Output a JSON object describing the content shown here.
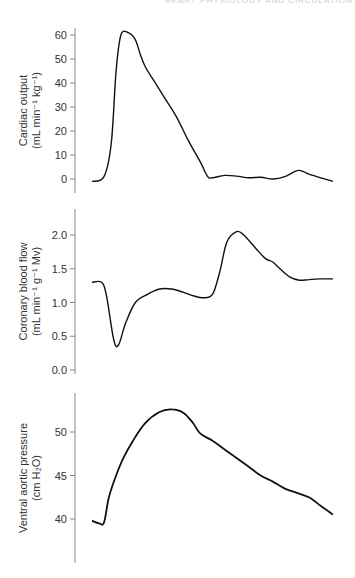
{
  "header": {
    "running_text": "HEART PHYSIOLOGY AND CIRCULATION"
  },
  "chart_data": [
    {
      "type": "line",
      "title": "",
      "xlabel": "",
      "ylabel": "Cardiac output (mL min⁻¹ kg⁻¹)",
      "ylabel_line1": "Cardiac output",
      "ylabel_line2": "(mL min⁻¹ kg⁻¹)",
      "yticks": [
        0,
        10,
        20,
        30,
        40,
        50,
        60
      ],
      "ylim": [
        -2,
        64
      ],
      "grid": false,
      "x": [
        0,
        5,
        8,
        10,
        12,
        15,
        18,
        20,
        22,
        25,
        30,
        35,
        40,
        45,
        48,
        50,
        55,
        60,
        65,
        70,
        75,
        80,
        85,
        88,
        90,
        95,
        100
      ],
      "series": [
        {
          "name": "Cardiac output",
          "values": [
            -1,
            1,
            15,
            45,
            60,
            61,
            58,
            52,
            47,
            42,
            34,
            26,
            16,
            7,
            1,
            0.5,
            1.5,
            1.2,
            0.5,
            0.7,
            0,
            1,
            3.5,
            3,
            2,
            0.5,
            -1
          ]
        }
      ]
    },
    {
      "type": "line",
      "title": "",
      "xlabel": "",
      "ylabel": "Coronary blood flow (mL min⁻¹ g⁻¹ Mv)",
      "ylabel_line1": "Coronary blood flow",
      "ylabel_line2": "(mL min⁻¹ g⁻¹ Mv)",
      "yticks": [
        0.0,
        0.5,
        1.0,
        1.5,
        2.0
      ],
      "ytick_labels": [
        "0.0",
        "0.5",
        "1.0",
        "1.5",
        "2.0"
      ],
      "ylim": [
        0,
        2.35
      ],
      "grid": false,
      "x": [
        0,
        4,
        6,
        9,
        11,
        14,
        18,
        23,
        28,
        33,
        38,
        42,
        46,
        50,
        53,
        56,
        60,
        63,
        68,
        72,
        75,
        78,
        82,
        86,
        90,
        95,
        100
      ],
      "series": [
        {
          "name": "Coronary blood flow",
          "values": [
            1.3,
            1.3,
            1.1,
            0.45,
            0.37,
            0.7,
            1.0,
            1.12,
            1.2,
            1.2,
            1.15,
            1.1,
            1.07,
            1.12,
            1.45,
            1.9,
            2.05,
            2.0,
            1.8,
            1.65,
            1.6,
            1.5,
            1.38,
            1.33,
            1.34,
            1.35,
            1.35
          ]
        }
      ]
    },
    {
      "type": "line",
      "title": "",
      "xlabel": "",
      "ylabel": "Ventral aortic pressure (cm H₂O)",
      "ylabel_line1": "Ventral aortic pressure",
      "ylabel_line2": "(cm H₂O)",
      "yticks": [
        40,
        45,
        50
      ],
      "ylim": [
        35.7,
        54.5
      ],
      "grid": false,
      "x": [
        0,
        3,
        5,
        7,
        10,
        13,
        17,
        22,
        28,
        33,
        38,
        42,
        45,
        50,
        55,
        60,
        65,
        70,
        75,
        80,
        85,
        90,
        95,
        100
      ],
      "series": [
        {
          "name": "Ventral aortic pressure",
          "values": [
            39.8,
            39.5,
            39.6,
            42.5,
            45,
            47,
            49,
            51,
            52.3,
            52.6,
            52.2,
            51,
            49.8,
            49,
            48,
            47,
            46,
            45,
            44.3,
            43.5,
            43,
            42.5,
            41.5,
            40.5
          ]
        }
      ]
    }
  ]
}
